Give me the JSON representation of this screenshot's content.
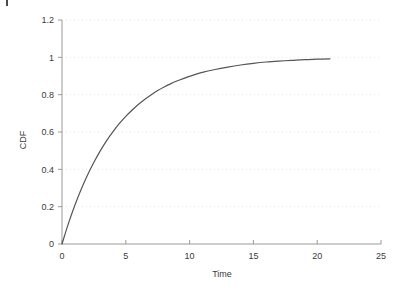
{
  "chart_data": {
    "type": "line",
    "title": "",
    "subtitle": "",
    "xlabel": "Time",
    "ylabel": "CDF",
    "xlim": [
      0,
      25
    ],
    "ylim": [
      0,
      1.2
    ],
    "grid": true,
    "grid_axis": "y",
    "legend": null,
    "legend_position": "none",
    "xticks": [
      0,
      5,
      10,
      15,
      20,
      25
    ],
    "xtick_labels": [
      "0",
      "5",
      "10",
      "15",
      "20",
      "25"
    ],
    "yticks": [
      0,
      0.2,
      0.4,
      0.6,
      0.8,
      1,
      1.2
    ],
    "ytick_labels": [
      "0",
      "0.2",
      "0.4",
      "0.6",
      "0.8",
      "1",
      "1.2"
    ],
    "series": [
      {
        "name": "CDF",
        "color": "#555555",
        "x": [
          0,
          0.5,
          1,
          1.4,
          2,
          2.5,
          3,
          3.5,
          4,
          4.5,
          5,
          5.5,
          6,
          6.5,
          7,
          7.5,
          8,
          8.5,
          9,
          9.5,
          10,
          11,
          12,
          13,
          14,
          15,
          16,
          17,
          18,
          19,
          20,
          21
        ],
        "y": [
          0,
          0.109,
          0.206,
          0.276,
          0.369,
          0.438,
          0.499,
          0.554,
          0.602,
          0.646,
          0.684,
          0.718,
          0.749,
          0.776,
          0.8,
          0.822,
          0.841,
          0.858,
          0.873,
          0.886,
          0.898,
          0.919,
          0.935,
          0.948,
          0.959,
          0.968,
          0.975,
          0.98,
          0.984,
          0.988,
          0.99,
          0.992
        ]
      }
    ],
    "annotations": []
  },
  "axes": {
    "y_title": "CDF",
    "x_title": "Time"
  },
  "colors": {
    "curve": "#555555",
    "axis": "#9a9a9a",
    "grid": "#e8e8e8",
    "text": "#3b3b3b",
    "background": "#ffffff"
  }
}
